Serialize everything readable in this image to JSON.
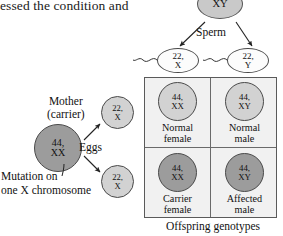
{
  "page": {
    "body_text": "essed the condition and"
  },
  "father": {
    "name": "father-cell",
    "genotype": "XY"
  },
  "sperm": {
    "label": "Sperm",
    "cells": [
      {
        "l1": "22,",
        "l2": "X"
      },
      {
        "l1": "22,",
        "l2": "Y"
      }
    ]
  },
  "mother": {
    "label_line1": "Mother",
    "label_line2": "(carrier)",
    "genotype_l1": "44,",
    "genotype_l2": "XX",
    "mutation_note_l1": "Mutation on",
    "mutation_note_l2": "one X chromosome"
  },
  "eggs": {
    "label": "Eggs",
    "cells": [
      {
        "l1": "22,",
        "l2": "X"
      },
      {
        "l1": "22,",
        "l2": "X"
      }
    ]
  },
  "punnett": {
    "caption": "Offspring genotypes",
    "quadrants": [
      {
        "position": "top-left",
        "geno_l1": "44,",
        "geno_l2": "XX",
        "pheno_l1": "Normal",
        "pheno_l2": "female",
        "shade": "light"
      },
      {
        "position": "top-right",
        "geno_l1": "44,",
        "geno_l2": "XY",
        "pheno_l1": "Normal",
        "pheno_l2": "male",
        "shade": "light"
      },
      {
        "position": "bottom-left",
        "geno_l1": "44,",
        "geno_l2": "XX",
        "pheno_l1": "Carrier",
        "pheno_l2": "female",
        "shade": "dark"
      },
      {
        "position": "bottom-right",
        "geno_l1": "44,",
        "geno_l2": "XY",
        "pheno_l1": "Affected",
        "pheno_l2": "male",
        "shade": "dark"
      }
    ]
  },
  "colors": {
    "light_gray_fill": "#d2d2d2",
    "dark_gray_fill": "#9c9c9c",
    "white_fill": "#fbfbfb",
    "square_bg": "#f1f1f1",
    "outline": "#4a4a4a",
    "text": "#111111"
  }
}
